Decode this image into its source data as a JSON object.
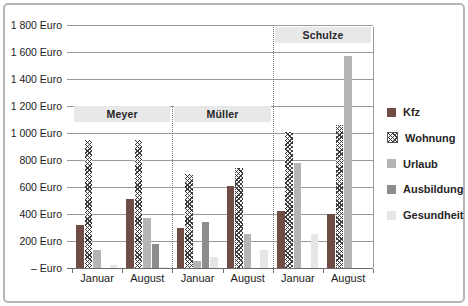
{
  "figure": {
    "y_axis_labels": [
      "1 800 Euro",
      "1 600 Euro",
      "1 400 Euro",
      "1 200 Euro",
      "1 000 Euro",
      "800 Euro",
      "600 Euro",
      "400 Euro",
      "200 Euro",
      "– Euro"
    ]
  },
  "chart_data": {
    "type": "bar",
    "title": "",
    "ylabel_unit": "Euro",
    "ylim": [
      0,
      1800
    ],
    "ytick_step": 200,
    "grid": true,
    "legend_position": "right",
    "categories": [
      "Januar",
      "August",
      "Januar",
      "August",
      "Januar",
      "August"
    ],
    "groups": [
      {
        "label": "Meyer",
        "months": [
          0,
          1
        ]
      },
      {
        "label": "Müller",
        "months": [
          2,
          3
        ]
      },
      {
        "label": "Schulze",
        "months": [
          4,
          5
        ]
      }
    ],
    "series": [
      {
        "name": "Kfz",
        "color": "#6f4c46",
        "pattern": "solid",
        "values": [
          320,
          510,
          300,
          610,
          420,
          400
        ]
      },
      {
        "name": "Wohnung",
        "color": "#fbfbfb",
        "pattern": "crosshatch",
        "values": [
          950,
          950,
          700,
          740,
          1010,
          1060
        ]
      },
      {
        "name": "Urlaub",
        "color": "#b5b5b5",
        "pattern": "solid",
        "values": [
          130,
          370,
          50,
          250,
          780,
          1570
        ]
      },
      {
        "name": "Ausbildung",
        "color": "#8d8d8d",
        "pattern": "solid",
        "values": [
          0,
          180,
          340,
          0,
          0,
          0
        ]
      },
      {
        "name": "Gesundheit",
        "color": "#e6e6e6",
        "pattern": "solid",
        "values": [
          20,
          10,
          80,
          130,
          250,
          0
        ]
      }
    ]
  }
}
